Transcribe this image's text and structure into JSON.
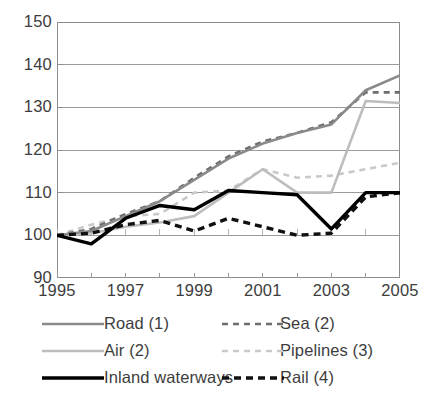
{
  "chart_data": {
    "type": "line",
    "title": "",
    "subtitle": "",
    "xlabel": "",
    "ylabel": "",
    "x": [
      1995,
      1996,
      1997,
      1998,
      1999,
      2000,
      2001,
      2002,
      2003,
      2004,
      2005
    ],
    "xlim": [
      1995,
      2005
    ],
    "ylim": [
      90,
      150
    ],
    "yticks": [
      90,
      100,
      110,
      120,
      130,
      140,
      150
    ],
    "xticks": [
      1995,
      1997,
      1999,
      2001,
      2003,
      2005
    ],
    "xtick_labels": [
      "1995",
      "1997",
      "1999",
      "2001",
      "2003",
      "2005"
    ],
    "ytick_labels": [
      "150",
      "140",
      "130",
      "120",
      "110",
      "100",
      "90"
    ],
    "grid": true,
    "grid_axis": "y",
    "legend_position": "bottom",
    "legend_columns": 2,
    "series": [
      {
        "name": "Road (1)",
        "style": "solid",
        "color": "#8a8a8a",
        "width": 2.6,
        "values": [
          100,
          101,
          104.5,
          108,
          113,
          118,
          121.5,
          124,
          126,
          134,
          137.5
        ]
      },
      {
        "name": "Sea (2)",
        "style": "dashed",
        "color": "#6e6e6e",
        "width": 2.6,
        "values": [
          100,
          101.5,
          105,
          108,
          113.5,
          118.5,
          122,
          124,
          126.5,
          133.5,
          133.5
        ]
      },
      {
        "name": "Air (2)",
        "style": "solid",
        "color": "#bdbdbd",
        "width": 2.6,
        "values": [
          100,
          100.5,
          102,
          103,
          104.5,
          110,
          115.5,
          110,
          110,
          131.5,
          131
        ]
      },
      {
        "name": "Pipelines (3)",
        "style": "dashed",
        "color": "#c9c9c9",
        "width": 2.6,
        "values": [
          100,
          102.5,
          104.5,
          105,
          110,
          110.5,
          115.5,
          113.5,
          114,
          115.5,
          117
        ]
      },
      {
        "name": "Inland waterways",
        "style": "solid",
        "color": "#000000",
        "width": 3.4,
        "values": [
          100,
          98,
          104,
          107,
          106,
          110.5,
          110,
          109.5,
          101.5,
          110,
          110
        ]
      },
      {
        "name": "Rail (4)",
        "style": "dashed",
        "color": "#111111",
        "width": 3.4,
        "values": [
          100,
          100.5,
          102.5,
          103.5,
          101,
          104,
          102,
          100,
          100.5,
          109,
          110
        ]
      }
    ]
  },
  "legend": {
    "left": [
      {
        "label": "Road (1)",
        "series": "Road (1)"
      },
      {
        "label": "Air (2)",
        "series": "Air (2)"
      },
      {
        "label": "Inland waterways",
        "series": "Inland waterways"
      }
    ],
    "right": [
      {
        "label": "Sea (2)",
        "series": "Sea (2)"
      },
      {
        "label": "Pipelines (3)",
        "series": "Pipelines (3)"
      },
      {
        "label": "Rail (4)",
        "series": "Rail (4)"
      }
    ]
  },
  "colors": {
    "axis": "#8c8c8c",
    "grid": "#9a9a9a",
    "text": "#3d3d3d",
    "background": "#ffffff"
  }
}
